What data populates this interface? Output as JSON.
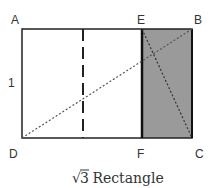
{
  "diagram": {
    "caption_radical": "√",
    "caption_number": "3",
    "caption_text": " Rectangle",
    "side_label": "1",
    "points": {
      "A": "A",
      "B": "B",
      "C": "C",
      "D": "D",
      "E": "E",
      "F": "F"
    },
    "colors": {
      "stroke": "#222222",
      "shaded_fill": "#9a9a9a",
      "dotted": "#555555",
      "text": "#333333"
    }
  }
}
